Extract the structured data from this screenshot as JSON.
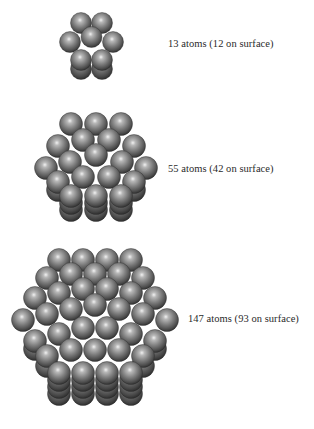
{
  "figure": {
    "clusters": [
      {
        "id": "cluster-13",
        "label": "13 atoms (12 on surface)",
        "atoms_total": 13,
        "atoms_surface": 12
      },
      {
        "id": "cluster-55",
        "label": "55 atoms (42 on surface)",
        "atoms_total": 55,
        "atoms_surface": 42
      },
      {
        "id": "cluster-147",
        "label": "147 atoms (93 on surface)",
        "atoms_total": 147,
        "atoms_surface": 93
      }
    ],
    "colors": {
      "sphere_highlight": "#e6e6e6",
      "sphere_mid": "#8a8a8a",
      "sphere_dark": "#3a3a3a",
      "label_text": "#2a2a2a",
      "background": "#ffffff"
    }
  }
}
